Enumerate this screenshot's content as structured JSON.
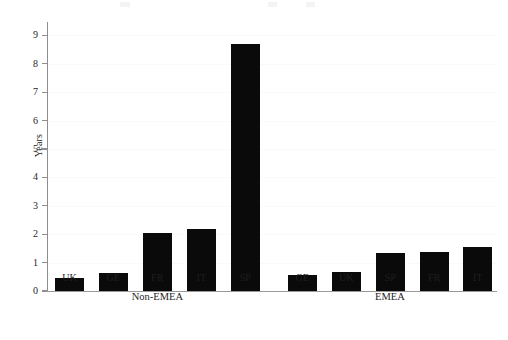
{
  "chart_data": {
    "type": "bar",
    "title": "",
    "subtitle": "",
    "xlabel": "",
    "ylabel": "Years",
    "ylim": [
      0,
      9.4
    ],
    "yticks": [
      0,
      1,
      2,
      3,
      4,
      5,
      6,
      7,
      8,
      9
    ],
    "ytick_labels": [
      "0",
      "1",
      "2",
      "3",
      "4",
      "5",
      "6",
      "7",
      "8",
      "9"
    ],
    "grid": true,
    "legend": false,
    "bar_color": "#0a0a0a",
    "categories": [
      "UK",
      "GE",
      "FR",
      "IT",
      "SP",
      "GE",
      "UK",
      "SP",
      "FR",
      "IT"
    ],
    "values": [
      0.45,
      0.63,
      2.05,
      2.2,
      8.7,
      0.57,
      0.67,
      1.35,
      1.37,
      1.55
    ],
    "groups": [
      {
        "label": "Non-EMEA",
        "categories": [
          "UK",
          "GE",
          "FR",
          "IT",
          "SP"
        ],
        "values": [
          0.45,
          0.63,
          2.05,
          2.2,
          8.7
        ]
      },
      {
        "label": "EMEA",
        "categories": [
          "GE",
          "UK",
          "SP",
          "FR",
          "IT"
        ],
        "values": [
          0.57,
          0.67,
          1.35,
          1.37,
          1.55
        ]
      }
    ]
  }
}
